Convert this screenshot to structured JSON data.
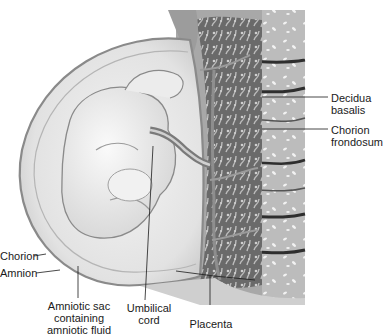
{
  "figure": {
    "colors": {
      "background": "#ffffff",
      "amniotic_fluid": "#e6e6e6",
      "chorion_edge": "#9a9a9a",
      "fetus": "#efefef",
      "placenta_dark": "#4a4a4a",
      "decidua": "#b8b8b8",
      "text": "#1a1a1a"
    }
  },
  "labels": {
    "decidua_basalis": "Decidua\nbasalis",
    "chorion_frondosum": "Chorion\nfrondosum",
    "chorion": "Chorion",
    "amnion": "Amnion",
    "amniotic_sac": "Amniotic sac\ncontaining\namniotic fluid",
    "umbilical_cord": "Umbilical\ncord",
    "placenta": "Placenta"
  }
}
